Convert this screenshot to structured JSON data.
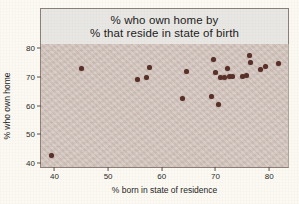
{
  "figure": {
    "background_color": "#fbf9f2",
    "plot_background_color": "#d4c6bf",
    "point_color": "#5a3028",
    "title_box_color": "#e9e7e4"
  },
  "title": {
    "line1": "% who own home by",
    "line2": "% that reside in state of birth"
  },
  "axes": {
    "x_title": "% born in state of residence",
    "y_title": "% who own home",
    "x_ticks": [
      "40",
      "50",
      "60",
      "70",
      "80"
    ],
    "y_ticks": [
      "40",
      "50",
      "60",
      "70",
      "80"
    ]
  },
  "chart_data": {
    "type": "scatter",
    "title": "% who own home by % that reside in state of birth",
    "xlabel": "% born in state of residence",
    "ylabel": "% who own home",
    "xlim": [
      37.5,
      83.5
    ],
    "ylim": [
      38.5,
      81.5
    ],
    "xticks": [
      40,
      50,
      60,
      70,
      80
    ],
    "yticks": [
      40,
      50,
      60,
      70,
      80
    ],
    "grid": false,
    "legend": "none",
    "marker": "filled-circle",
    "marker_color": "#5a3028",
    "points": [
      {
        "x": 39.5,
        "y": 42.5
      },
      {
        "x": 45.0,
        "y": 72.8
      },
      {
        "x": 55.5,
        "y": 69.2
      },
      {
        "x": 57.2,
        "y": 69.8
      },
      {
        "x": 57.7,
        "y": 73.3
      },
      {
        "x": 63.9,
        "y": 62.3
      },
      {
        "x": 64.6,
        "y": 71.9
      },
      {
        "x": 69.3,
        "y": 63.1
      },
      {
        "x": 69.6,
        "y": 76.1
      },
      {
        "x": 70.0,
        "y": 71.6
      },
      {
        "x": 70.6,
        "y": 60.3
      },
      {
        "x": 70.9,
        "y": 69.7
      },
      {
        "x": 71.7,
        "y": 69.8
      },
      {
        "x": 72.2,
        "y": 73.1
      },
      {
        "x": 72.6,
        "y": 70.2
      },
      {
        "x": 73.2,
        "y": 70.1
      },
      {
        "x": 75.0,
        "y": 70.3
      },
      {
        "x": 75.7,
        "y": 70.6
      },
      {
        "x": 76.3,
        "y": 77.6
      },
      {
        "x": 76.5,
        "y": 74.9
      },
      {
        "x": 78.3,
        "y": 72.6
      },
      {
        "x": 79.4,
        "y": 73.6
      },
      {
        "x": 81.8,
        "y": 74.8
      }
    ]
  }
}
